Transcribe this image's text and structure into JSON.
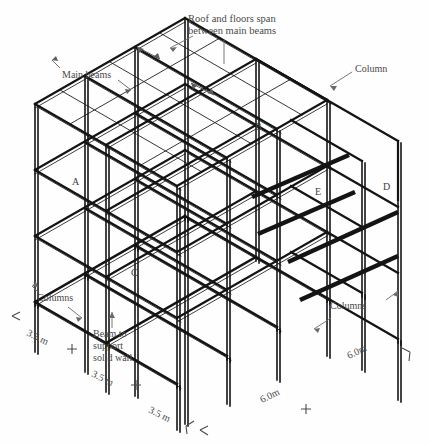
{
  "figure": {
    "kind": "isometric-structural-frame-diagram",
    "background_color": "#fefefe",
    "line_color": "#141414",
    "text_color": "#4a4a4a"
  },
  "annotations": {
    "roof_span_note": "Roof and floors span\nbetween main beams",
    "main_beams": "Main beams",
    "column_singular": "Column",
    "columns_left": "Columns",
    "columns_right": "Columns",
    "beam_solid_wall": "Beam to\nsupport\nsolid wall"
  },
  "node_labels": [
    {
      "id": "A",
      "text": "A"
    },
    {
      "id": "B",
      "text": "B"
    },
    {
      "id": "C",
      "text": "C"
    },
    {
      "id": "D",
      "text": "D"
    },
    {
      "id": "E",
      "text": "E"
    }
  ],
  "dimensions": {
    "left_bay_label": "3.5 m",
    "right_bay_label": "6.0m",
    "left_bays": [
      {
        "value": "3.5 m"
      },
      {
        "value": "3.5 m"
      },
      {
        "value": "3.5 m"
      }
    ],
    "right_bays": [
      {
        "value": "6.0m"
      },
      {
        "value": "6.0m"
      }
    ]
  },
  "grid": {
    "left_bay_count": 3,
    "right_bay_count": 2,
    "storeys": 4,
    "left_bay_spacing_m": 3.5,
    "right_bay_spacing_m": 6.0
  }
}
